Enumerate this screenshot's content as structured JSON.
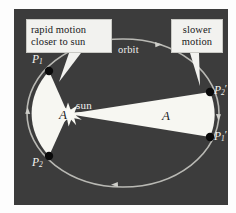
{
  "figure": {
    "panel_bg": "#3c3c3c",
    "page_bg": "#fdfdfd"
  },
  "callouts": [
    {
      "name": "rapid-motion",
      "line1": "rapid motion",
      "line2": "closer to sun",
      "points_to": "P1"
    },
    {
      "name": "slower-motion",
      "line1": "slower",
      "line2": "motion",
      "points_to": "P2prime"
    }
  ],
  "labels": {
    "orbit": "orbit",
    "sun": "sun",
    "area_left": "A",
    "area_right": "A",
    "p1": "P",
    "p1_sub": "1",
    "p2": "P",
    "p2_sub": "2",
    "p2prime": "P",
    "p2prime_sub": "2",
    "p2prime_mark": "′",
    "p1prime": "P",
    "p1prime_sub": "1",
    "p1prime_mark": "′"
  },
  "colors": {
    "orbit_stroke": "#b9b9b4",
    "sector_fill": "#f7f7f2",
    "sun_fill": "#f8f8f2",
    "point_fill": "#0a0a0a",
    "callout_fill": "#f2f2ef",
    "text_light": "#f4f4f1",
    "text_dark": "#18181a"
  },
  "geometry": {
    "ellipse_center_x": 109,
    "ellipse_center_y": 104,
    "ellipse_rx": 96,
    "ellipse_ry": 74,
    "sun_x": 54,
    "sun_y": 105,
    "p1_x": 35,
    "p1_y": 62,
    "p2_x": 35,
    "p2_y": 147,
    "p2prime_x": 196,
    "p2prime_y": 83,
    "p1prime_x": 196,
    "p1prime_y": 128
  }
}
